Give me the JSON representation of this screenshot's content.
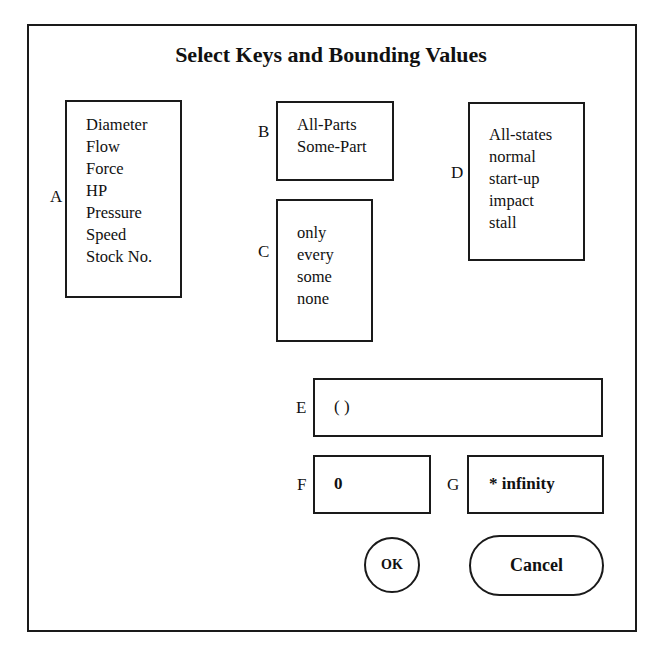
{
  "dialog": {
    "title": "Select Keys and Bounding Values"
  },
  "fields": {
    "A": {
      "label": "A",
      "items": [
        "Diameter",
        "Flow",
        "Force",
        "HP",
        "Pressure",
        "Speed",
        "Stock No."
      ]
    },
    "B": {
      "label": "B",
      "items": [
        "All-Parts",
        "Some-Part"
      ]
    },
    "C": {
      "label": "C",
      "items": [
        "only",
        "every",
        "some",
        "none"
      ]
    },
    "D": {
      "label": "D",
      "items": [
        "All-states",
        "normal",
        "start-up",
        "impact",
        "stall"
      ]
    },
    "E": {
      "label": "E",
      "value": "( )"
    },
    "F": {
      "label": "F",
      "value": "0"
    },
    "G": {
      "label": "G",
      "value": "* infinity"
    }
  },
  "buttons": {
    "ok": "OK",
    "cancel": "Cancel"
  }
}
